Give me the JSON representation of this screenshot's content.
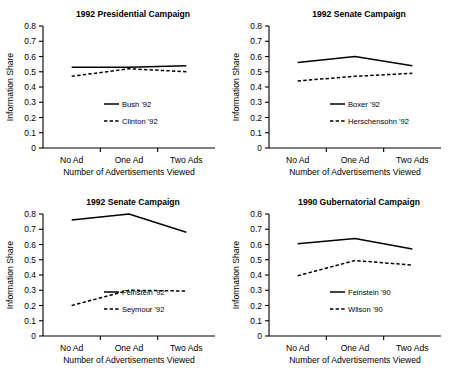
{
  "figure": {
    "panel_count": 4,
    "line_color": "#000000",
    "background": "#ffffff"
  },
  "chart_data": [
    {
      "type": "line",
      "title": "1992 Presidential Campaign",
      "xlabel": "Number of Advertisements Viewed",
      "ylabel": "Information Share",
      "categories": [
        "No Ad",
        "One Ad",
        "Two Ads"
      ],
      "ylim": [
        0,
        0.8
      ],
      "yticks": [
        "0",
        "0.1",
        "0.2",
        "0.3",
        "0.4",
        "0.5",
        "0.6",
        "0.7",
        "0.8"
      ],
      "grid": false,
      "legend_position": "lower-right",
      "series": [
        {
          "name": "Bush '92",
          "values": [
            0.53,
            0.53,
            0.54
          ],
          "style": "solid"
        },
        {
          "name": "Clinton '92",
          "values": [
            0.47,
            0.52,
            0.5
          ],
          "style": "dashed"
        }
      ]
    },
    {
      "type": "line",
      "title": "1992 Senate Campaign",
      "xlabel": "Number of Advertisements Viewed",
      "ylabel": "Information Share",
      "categories": [
        "No Ad",
        "One Ad",
        "Two Ads"
      ],
      "ylim": [
        0,
        0.8
      ],
      "yticks": [
        "0",
        "0.1",
        "0.2",
        "0.3",
        "0.4",
        "0.5",
        "0.6",
        "0.7",
        "0.8"
      ],
      "grid": false,
      "legend_position": "lower-right",
      "series": [
        {
          "name": "Boxer '92",
          "values": [
            0.56,
            0.6,
            0.54
          ],
          "style": "solid"
        },
        {
          "name": "Herschensohn '92",
          "values": [
            0.44,
            0.47,
            0.49
          ],
          "style": "dashed"
        }
      ]
    },
    {
      "type": "line",
      "title": "1992 Senate Campaign",
      "xlabel": "Number of Advertisements Viewed",
      "ylabel": "Information Share",
      "categories": [
        "No Ad",
        "One Ad",
        "Two Ads"
      ],
      "ylim": [
        0,
        0.8
      ],
      "yticks": [
        "0",
        "0.1",
        "0.2",
        "0.3",
        "0.4",
        "0.5",
        "0.6",
        "0.7",
        "0.8"
      ],
      "grid": false,
      "legend_position": "lower-right",
      "series": [
        {
          "name": "Feinstein '92",
          "values": [
            0.76,
            0.8,
            0.68
          ],
          "style": "solid"
        },
        {
          "name": "Seymour '92",
          "values": [
            0.2,
            0.3,
            0.295
          ],
          "style": "dashed"
        }
      ]
    },
    {
      "type": "line",
      "title": "1990 Gubernatorial Campaign",
      "xlabel": "Number of Advertisements Viewed",
      "ylabel": "Information Share",
      "categories": [
        "No Ad",
        "One Ad",
        "Two Ads"
      ],
      "ylim": [
        0,
        0.8
      ],
      "yticks": [
        "0",
        "0.1",
        "0.2",
        "0.3",
        "0.4",
        "0.5",
        "0.6",
        "0.7",
        "0.8"
      ],
      "grid": false,
      "legend_position": "lower-right",
      "series": [
        {
          "name": "Feinstein '90",
          "values": [
            0.605,
            0.64,
            0.57
          ],
          "style": "solid"
        },
        {
          "name": "Wilson '90",
          "values": [
            0.395,
            0.495,
            0.465
          ],
          "style": "dashed"
        }
      ]
    }
  ]
}
